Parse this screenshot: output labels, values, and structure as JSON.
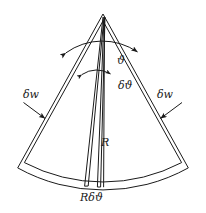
{
  "figure": {
    "name": "circular-sector-element-diagram",
    "background_color": "#ffffff",
    "stroke_color": "#1a1a1a",
    "labels": {
      "theta": "ϑ",
      "delta_theta": "δϑ",
      "delta_w_left": "δw",
      "delta_w_right": "δw",
      "radius": "R",
      "arc_length": "Rδϑ"
    },
    "geometry": {
      "apex_x": 103,
      "apex_y": 14,
      "radius_outer": 176,
      "radius_inner": 170,
      "half_angle_deg": 29,
      "wedge_center_angle_deg": -3.5,
      "wedge_half_width_deg": 3.0
    },
    "annotations": [
      {
        "name": "theta-arc",
        "kind": "double-headed-arc-arrow",
        "spans": "full sector angle"
      },
      {
        "name": "delta-theta-arc",
        "kind": "double-headed-arc-arrow",
        "spans": "narrow wedge angle"
      },
      {
        "name": "delta-w-left-arrow",
        "kind": "straight-arrow",
        "direction": "down-right"
      },
      {
        "name": "delta-w-right-arrow",
        "kind": "straight-arrow",
        "direction": "down-left"
      },
      {
        "name": "radius-line",
        "kind": "line",
        "from": "apex",
        "to": "arc"
      }
    ]
  }
}
